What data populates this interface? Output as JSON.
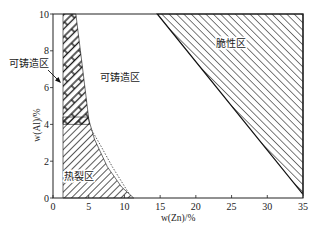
{
  "chart_data": {
    "type": "area",
    "title": "",
    "xlabel": "w(Zn)/%",
    "ylabel": "w(Al)/%",
    "xlim": [
      0,
      35
    ],
    "ylim": [
      0,
      10
    ],
    "xticks": [
      0,
      5,
      10,
      15,
      20,
      25,
      30,
      35
    ],
    "yticks": [
      0,
      2,
      4,
      6,
      8,
      10
    ],
    "grid": false,
    "regions": [
      {
        "name": "castable-boundary-strip",
        "label": "",
        "style": "bands",
        "points": [
          [
            1.4,
            10
          ],
          [
            3.2,
            10
          ],
          [
            4.0,
            7.5
          ],
          [
            5.1,
            4.0
          ],
          [
            1.4,
            4.0
          ]
        ]
      },
      {
        "name": "hot-crack-zone",
        "label": "热裂区",
        "style": "hatch-back",
        "points": [
          [
            1.4,
            4.4
          ],
          [
            4.9,
            4.4
          ],
          [
            5.8,
            3.2
          ],
          [
            7.6,
            1.7
          ],
          [
            9.6,
            0.6
          ],
          [
            11.3,
            0
          ],
          [
            1.4,
            0
          ]
        ]
      },
      {
        "name": "brittle-zone",
        "label": "脆性区",
        "style": "hatch-forward",
        "points": [
          [
            14.6,
            10
          ],
          [
            35,
            10
          ],
          [
            35,
            0.2
          ]
        ]
      }
    ],
    "dashed_boundary": [
      [
        5.4,
        3.7
      ],
      [
        6.6,
        2.9
      ],
      [
        8.3,
        1.7
      ],
      [
        10.7,
        0.2
      ]
    ],
    "annotations": [
      {
        "text": "可铸造区",
        "x": 6.6,
        "y": 6.6,
        "kind": "region"
      },
      {
        "text": "可铸造区",
        "outside": true,
        "arrow_to": [
          1.3,
          6.6
        ]
      },
      {
        "text": "脆性区",
        "x": 24.6,
        "y": 9.0,
        "kind": "region"
      },
      {
        "text": "热裂区",
        "x": 3.9,
        "y": 1.2,
        "kind": "region"
      }
    ]
  }
}
